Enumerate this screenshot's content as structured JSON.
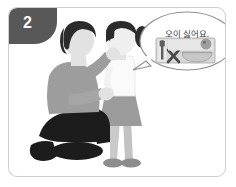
{
  "panel": {
    "step_number": "2",
    "background_color": "#ffffff",
    "frame_border_color": "#cfcfcf",
    "badge_color": "#585858"
  },
  "speech_bubble": {
    "text": "오이 싫어요.",
    "bubble_fill": "#ffffff",
    "bubble_stroke": "#8f8f8f",
    "tail_direction": "left-down"
  },
  "food_tray": {
    "tray_fill": "#d8d8d8",
    "tray_stroke": "#9a9a9a",
    "fork_color": "#5e5e5e",
    "x_mark_color": "#4a4a4a",
    "plate_color": "#bdbdbd",
    "bowl_color": "#c7c7c7",
    "items": [
      "fork",
      "x-mark",
      "plate",
      "bowl"
    ]
  },
  "figures": {
    "adult": {
      "name": "kneeling-adult",
      "hair_color": "#2b2b2b",
      "skin_color": "#e2e2e2",
      "shirt_color": "#9d9d9d",
      "pants_color": "#1c1c1c",
      "shoe_color": "#1c1c1c",
      "pose": "kneeling"
    },
    "child": {
      "name": "standing-child",
      "hair_color": "#2b2b2b",
      "skin_color": "#efefef",
      "top_color": "#fafafa",
      "skirt_color": "#9b9b9b",
      "legs_color": "#c9c9c9",
      "shoe_color": "#8d8d8d",
      "pose": "standing"
    }
  },
  "colors": {
    "ink_dark": "#2b2b2b",
    "gray_mid": "#9d9d9d",
    "gray_light": "#d8d8d8",
    "white": "#ffffff"
  }
}
